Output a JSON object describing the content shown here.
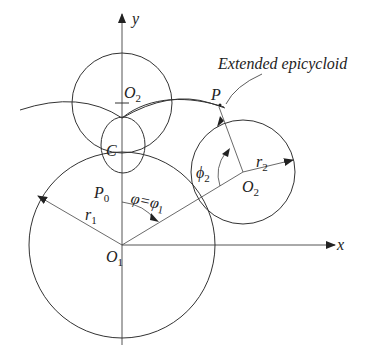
{
  "diagram": {
    "title_annotation": "Extended epicycloid",
    "axes": {
      "x_label": "x",
      "y_label": "y"
    },
    "points": {
      "O1": {
        "base": "O",
        "sub": "1"
      },
      "O2_top": {
        "base": "O",
        "sub": "2"
      },
      "O2_right": {
        "base": "O",
        "sub": "2"
      },
      "C": "C",
      "P": "P",
      "P0": {
        "base": "P",
        "sub": "0"
      }
    },
    "radii": {
      "r1": {
        "base": "r",
        "sub": "1"
      },
      "r2": {
        "base": "r",
        "sub": "2"
      }
    },
    "angles": {
      "phi_eq": {
        "text": "φ=φ",
        "sub": "1"
      },
      "phi2": {
        "base": "ϕ",
        "sub": "2"
      }
    },
    "colors": {
      "stroke": "#333333",
      "axis": "#555555",
      "background": "#ffffff"
    }
  }
}
